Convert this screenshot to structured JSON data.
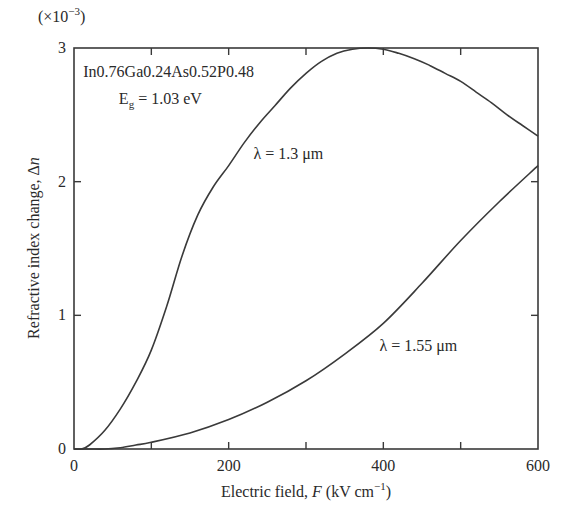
{
  "chart_data": {
    "type": "line",
    "title": "",
    "xlabel": "Electric field, F (kV cm⁻¹)",
    "xlabel_parts": {
      "prefix": "Electric field, ",
      "var": "F",
      "suffix": " (kV cm",
      "sup": "−1",
      "close": ")"
    },
    "ylabel": "Refractive index change, Δn",
    "ylabel_parts": {
      "prefix": "Refractive index change, Δ",
      "var": "n"
    },
    "y_multiplier": "(×10⁻³)",
    "y_multiplier_parts": {
      "prefix": "(×10",
      "sup": "−3",
      "close": ")"
    },
    "xlim": [
      0,
      600
    ],
    "ylim": [
      0,
      3
    ],
    "x_ticks": [
      0,
      200,
      400,
      600
    ],
    "x_minor_ticks": [
      100,
      300,
      500
    ],
    "y_ticks": [
      0,
      1,
      2,
      3
    ],
    "grid": false,
    "legend": "none (inline curve labels)",
    "annotations": [
      {
        "text": "In0.76Ga0.24As0.52P0.48",
        "x": 12,
        "y": 2.78
      },
      {
        "text_parts": {
          "prefix": "E",
          "sub": "g",
          "suffix": " = 1.03 eV"
        },
        "text": "Eg = 1.03 eV",
        "x": 58,
        "y": 2.58
      }
    ],
    "series": [
      {
        "name": "λ = 1.3 μm",
        "label_pos": {
          "x": 232,
          "y": 2.17
        },
        "x": [
          0,
          10,
          20,
          40,
          60,
          80,
          100,
          120,
          140,
          160,
          180,
          200,
          220,
          240,
          260,
          280,
          300,
          320,
          340,
          360,
          380,
          400,
          420,
          440,
          460,
          480,
          500,
          520,
          540,
          560,
          580,
          600
        ],
        "values": [
          0,
          0.0,
          0.03,
          0.14,
          0.3,
          0.5,
          0.74,
          1.07,
          1.45,
          1.75,
          1.96,
          2.12,
          2.29,
          2.44,
          2.57,
          2.7,
          2.81,
          2.9,
          2.96,
          2.99,
          3.0,
          2.99,
          2.96,
          2.92,
          2.87,
          2.81,
          2.75,
          2.67,
          2.59,
          2.5,
          2.42,
          2.34
        ]
      },
      {
        "name": "λ = 1.55 μm",
        "label_pos": {
          "x": 395,
          "y": 0.73
        },
        "x": [
          0,
          20,
          40,
          60,
          80,
          100,
          150,
          200,
          250,
          300,
          350,
          400,
          450,
          500,
          550,
          600
        ],
        "values": [
          0,
          0.0,
          0.0,
          0.01,
          0.03,
          0.05,
          0.12,
          0.22,
          0.35,
          0.51,
          0.71,
          0.94,
          1.24,
          1.56,
          1.85,
          2.12
        ]
      }
    ]
  }
}
